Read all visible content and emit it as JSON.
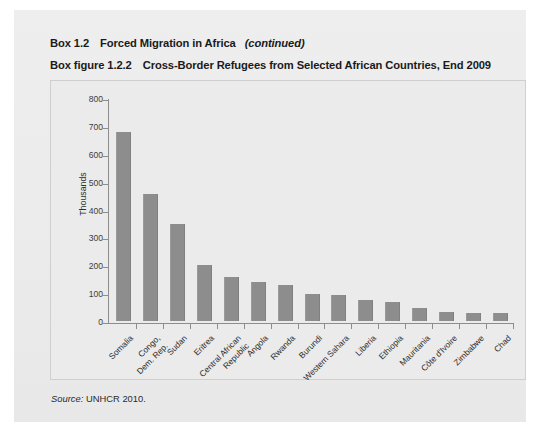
{
  "box": {
    "tag": "Box 1.2",
    "title": "Forced Migration in Africa",
    "continued": "(continued)"
  },
  "figure": {
    "tag": "Box figure 1.2.2",
    "title": "Cross-Border Refugees from Selected African Countries, End 2009"
  },
  "source": {
    "label": "Source:",
    "text": "UNHCR 2010."
  },
  "colors": {
    "bar": "#8d8d8d",
    "panel": "#ebebeb",
    "axis": "#8d8d8d",
    "page": "#ffffff"
  },
  "chart_data": {
    "type": "bar",
    "title": "Cross-Border Refugees from Selected African Countries, End 2009",
    "xlabel": "",
    "ylabel": "Thousands",
    "ylim": [
      0,
      800
    ],
    "yticks": [
      0,
      100,
      200,
      300,
      400,
      500,
      600,
      700,
      800
    ],
    "ytick_labels": [
      "0",
      "100",
      "200",
      "300",
      "400",
      "500",
      "600",
      "700",
      "800"
    ],
    "grid": false,
    "legend": null,
    "categories": [
      "Somalia",
      "Congo,\nDem. Rep.",
      "Sudan",
      "Eritrea",
      "Central African\nRepublic",
      "Angola",
      "Rwanda",
      "Burundi",
      "Western Sahara",
      "Liberia",
      "Ethiopia",
      "Mauritania",
      "Côte d'Ivoire",
      "Zimbabwe",
      "Chad"
    ],
    "values": [
      678,
      455,
      348,
      200,
      157,
      141,
      128,
      98,
      95,
      75,
      68,
      45,
      32,
      30,
      28
    ]
  }
}
